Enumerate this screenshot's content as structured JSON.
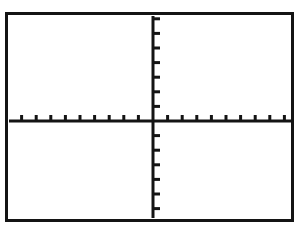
{
  "screen": {
    "title": "Graphing Calculator Coordinate Plane",
    "background_color": "#ffffff",
    "ink_color": "#141414",
    "border_color": "#141414"
  },
  "chart_data": {
    "type": "scatter",
    "title": "",
    "subtitle": "",
    "xlabel": "",
    "ylabel": "",
    "grid": false,
    "legend": null,
    "legend_position": "none",
    "series": [],
    "x": [],
    "values": [],
    "categories": [],
    "xlim": [
      -10,
      10
    ],
    "ylim": [
      -7,
      7
    ],
    "x_tick_step": 1,
    "y_tick_step": 1,
    "x_tick_values": [
      -10,
      -9,
      -8,
      -7,
      -6,
      -5,
      -4,
      -3,
      -2,
      -1,
      1,
      2,
      3,
      4,
      5,
      6,
      7,
      8,
      9,
      10
    ],
    "y_tick_values": [
      -7,
      -6,
      -5,
      -4,
      -3,
      -2,
      -1,
      1,
      2,
      3,
      4,
      5,
      6,
      7
    ],
    "x_tick_labels": [],
    "y_tick_labels": [],
    "origin": {
      "x": 0,
      "y": 0
    },
    "axis_color": "#141414",
    "tick_color": "#141414"
  },
  "geometry": {
    "origin_px": {
      "x": 145,
      "y": 106
    },
    "x_axis": {
      "start_px": 1,
      "end_px": 288,
      "y_px": 106
    },
    "y_axis": {
      "x_px": 145,
      "start_px": 1,
      "end_px": 203
    },
    "tick_spacing_px": 14.6,
    "x_tick_length_px": 6,
    "y_tick_length_px": 7,
    "axis_stroke_px": 3,
    "tick_stroke_px": 3
  }
}
